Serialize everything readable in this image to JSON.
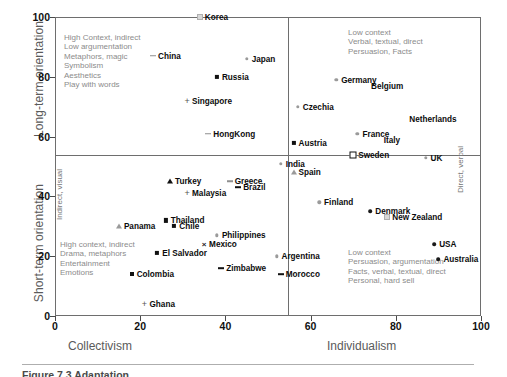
{
  "figure": {
    "caption": "Figure 7.3  Adaptation ...",
    "caption_visible_note": "caption cropped at image bottom edge"
  },
  "chart_data": {
    "type": "scatter",
    "title": "",
    "xlabel_left": "Collectivism",
    "xlabel_right": "Individualism",
    "ylabel_top": "Long-term orientation",
    "ylabel_bottom": "Short-term orientation",
    "xlim": [
      0,
      100
    ],
    "ylim": [
      0,
      100
    ],
    "xticks": [
      0,
      20,
      40,
      60,
      80,
      100
    ],
    "yticks": [
      0,
      20,
      40,
      60,
      80,
      100
    ],
    "grid": false,
    "legend": "none",
    "divider_x": 55,
    "divider_y": 54,
    "side_label_left": "Indirect, visual",
    "side_label_right": "Direct, verbal",
    "annotations": [
      {
        "position": "top-left",
        "lines": [
          "High Context, indirect",
          "Low argumentation",
          "Metaphors, magic",
          "Symbolism",
          "Aesthetics",
          "Play with words"
        ]
      },
      {
        "position": "top-right",
        "lines": [
          "Low context",
          "Verbal, textual, direct",
          "Persuasion, Facts"
        ]
      },
      {
        "position": "bottom-left",
        "lines": [
          "High context, indirect",
          "Drama, metaphors",
          "Entertainment",
          "Emotions"
        ]
      },
      {
        "position": "bottom-right",
        "lines": [
          "Low context",
          "Persuasion, argumentation",
          "Facts, verbal, textual, direct",
          "Personal, hard sell"
        ]
      }
    ],
    "points": [
      {
        "label": "Korea",
        "x": 34,
        "y": 100,
        "marker": "tick",
        "side": "left"
      },
      {
        "label": "China",
        "x": 23,
        "y": 87,
        "marker": "dashg",
        "side": "left"
      },
      {
        "label": "Japan",
        "x": 45,
        "y": 86,
        "marker": "dot",
        "side": "left"
      },
      {
        "label": "Russia",
        "x": 38,
        "y": 80,
        "marker": "dia",
        "side": "left"
      },
      {
        "label": "Germany",
        "x": 66,
        "y": 79,
        "marker": "dot",
        "side": "left"
      },
      {
        "label": "Belgium",
        "x": 73,
        "y": 77,
        "marker": "none",
        "side": "left"
      },
      {
        "label": "Singapore",
        "x": 31,
        "y": 72,
        "marker": "plus",
        "side": "left"
      },
      {
        "label": "Czechia",
        "x": 57,
        "y": 70,
        "marker": "dot",
        "side": "left"
      },
      {
        "label": "Netherlands",
        "x": 82,
        "y": 66,
        "marker": "none",
        "side": "left"
      },
      {
        "label": "HongKong",
        "x": 36,
        "y": 61,
        "marker": "dashg",
        "side": "left"
      },
      {
        "label": "France",
        "x": 71,
        "y": 61,
        "marker": "dot",
        "side": "left"
      },
      {
        "label": "Italy",
        "x": 76,
        "y": 59,
        "marker": "none",
        "side": "left"
      },
      {
        "label": "Austria",
        "x": 56,
        "y": 58,
        "marker": "dia",
        "side": "left"
      },
      {
        "label": "Sweden",
        "x": 70,
        "y": 54,
        "marker": "diao",
        "side": "left"
      },
      {
        "label": "UK",
        "x": 87,
        "y": 53,
        "marker": "dot",
        "side": "left"
      },
      {
        "label": "India",
        "x": 53,
        "y": 51,
        "marker": "dot",
        "side": "left"
      },
      {
        "label": "Spain",
        "x": 56,
        "y": 48,
        "marker": "trig",
        "side": "left"
      },
      {
        "label": "Turkey",
        "x": 27,
        "y": 45,
        "marker": "tri",
        "side": "left"
      },
      {
        "label": "Greece",
        "x": 41,
        "y": 45,
        "marker": "dashg",
        "side": "left"
      },
      {
        "label": "Brazil",
        "x": 43,
        "y": 43,
        "marker": "dash",
        "side": "left"
      },
      {
        "label": "Malaysia",
        "x": 31,
        "y": 41,
        "marker": "plus",
        "side": "left"
      },
      {
        "label": "Finland",
        "x": 62,
        "y": 38,
        "marker": "dot",
        "side": "left"
      },
      {
        "label": "Denmark",
        "x": 74,
        "y": 35,
        "marker": "dotdark",
        "side": "left"
      },
      {
        "label": "New Zealand",
        "x": 78,
        "y": 33,
        "marker": "tick",
        "side": "left"
      },
      {
        "label": "Thailand",
        "x": 26,
        "y": 32,
        "marker": "dia",
        "side": "left"
      },
      {
        "label": "Panama",
        "x": 15,
        "y": 30,
        "marker": "trig",
        "side": "left"
      },
      {
        "label": "Chile",
        "x": 28,
        "y": 30,
        "marker": "dia",
        "side": "left"
      },
      {
        "label": "Philippines",
        "x": 38,
        "y": 27,
        "marker": "dot",
        "side": "left"
      },
      {
        "label": "Mexico",
        "x": 35,
        "y": 24,
        "marker": "x",
        "side": "left"
      },
      {
        "label": "USA",
        "x": 89,
        "y": 24,
        "marker": "dotdark",
        "side": "left"
      },
      {
        "label": "El Salvador",
        "x": 24,
        "y": 21,
        "marker": "dia",
        "side": "left"
      },
      {
        "label": "Australia",
        "x": 90,
        "y": 19,
        "marker": "dotdark",
        "side": "left"
      },
      {
        "label": "Argentina",
        "x": 52,
        "y": 20,
        "marker": "dot",
        "side": "left"
      },
      {
        "label": "Zimbabwe",
        "x": 39,
        "y": 16,
        "marker": "dash",
        "side": "left"
      },
      {
        "label": "Colombia",
        "x": 18,
        "y": 14,
        "marker": "sq",
        "side": "left"
      },
      {
        "label": "Morocco",
        "x": 53,
        "y": 14,
        "marker": "dash",
        "side": "left"
      },
      {
        "label": "Ghana",
        "x": 21,
        "y": 4,
        "marker": "plus",
        "side": "left"
      }
    ]
  },
  "colors": {
    "axis": "#6e6e6e",
    "annotation_text": "#8b8b8b",
    "axis_title": "#5a5a5a",
    "point_label": "#0c0c0c",
    "marker_light": "#9a9a9a",
    "marker_dark": "#111111"
  }
}
